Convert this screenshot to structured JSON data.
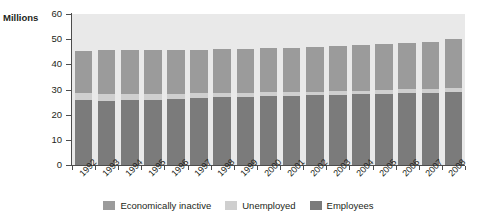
{
  "chart_data": {
    "type": "bar",
    "subtype": "stacked-column",
    "title": "",
    "xlabel": "",
    "ylabel": "Millions",
    "ylim": [
      0,
      60
    ],
    "yticks": [
      0,
      10,
      20,
      30,
      40,
      50,
      60
    ],
    "grid": false,
    "legend_position": "bottom-center",
    "categories": [
      "1992",
      "1993",
      "1994",
      "1995",
      "1996",
      "1997",
      "1998",
      "1999",
      "2000",
      "2001",
      "2002",
      "2003",
      "2004",
      "2005",
      "2006",
      "2007",
      "2008"
    ],
    "series": [
      {
        "name": "Employees",
        "color": "#7b7b7b",
        "values": [
          25.8,
          25.6,
          25.7,
          25.9,
          26.2,
          26.6,
          26.9,
          27.1,
          27.4,
          27.6,
          27.7,
          27.9,
          28.1,
          28.3,
          28.5,
          28.8,
          29.0
        ]
      },
      {
        "name": "Unemployed",
        "color": "#cfcfcf",
        "values": [
          2.7,
          2.8,
          2.6,
          2.3,
          2.1,
          1.9,
          1.7,
          1.7,
          1.6,
          1.5,
          1.5,
          1.4,
          1.4,
          1.4,
          1.6,
          1.6,
          1.7
        ]
      },
      {
        "name": "Economically inactive",
        "color": "#9b9b9b",
        "values": [
          17.0,
          17.2,
          17.3,
          17.4,
          17.4,
          17.4,
          17.5,
          17.5,
          17.5,
          17.5,
          17.6,
          17.8,
          18.2,
          18.4,
          18.4,
          18.6,
          19.3
        ]
      }
    ],
    "totals": [
      45.5,
      45.6,
      45.6,
      45.6,
      45.7,
      45.9,
      46.1,
      46.3,
      46.5,
      46.6,
      46.8,
      47.1,
      47.7,
      48.1,
      48.5,
      49.0,
      50.0
    ]
  },
  "title_sliver": "",
  "y_axis": {
    "title": "Millions",
    "ticks": [
      "60",
      "50",
      "40",
      "30",
      "20",
      "10",
      "0"
    ]
  },
  "legend": {
    "items": [
      {
        "label": "Economically inactive",
        "color": "#9b9b9b"
      },
      {
        "label": "Unemployed",
        "color": "#cfcfcf"
      },
      {
        "label": "Employees",
        "color": "#7b7b7b"
      }
    ]
  }
}
